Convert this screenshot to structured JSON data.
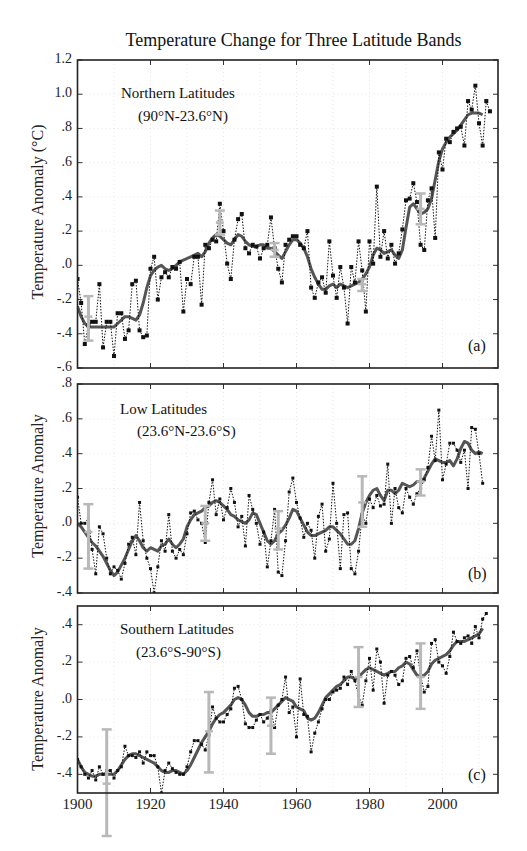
{
  "title": "Temperature Change for Three Latitude Bands",
  "x_tick_labels": [
    "1900",
    "1920",
    "1940",
    "1960",
    "1980",
    "2000"
  ],
  "panels": [
    {
      "id": "a",
      "letter": "(a)",
      "name_line1": "Northern Latitudes",
      "name_line2": "(90°N-23.6°N)",
      "ylabel": "Temperature Anomaly (°C)",
      "y_tick_labels": [
        "1.2",
        "1.0",
        ".8",
        ".6",
        ".4",
        ".2",
        ".0",
        "-.2",
        "-.4",
        "-.6"
      ]
    },
    {
      "id": "b",
      "letter": "(b)",
      "name_line1": "Low Latitudes",
      "name_line2": "(23.6°N-23.6°S)",
      "ylabel": "Temperature Anomaly",
      "y_tick_labels": [
        ".8",
        ".6",
        ".4",
        ".2",
        ".0",
        "-.2",
        "-.4"
      ]
    },
    {
      "id": "c",
      "letter": "(c)",
      "name_line1": "Southern Latitudes",
      "name_line2": "(23.6°S-90°S)",
      "ylabel": "Temperature Anomaly",
      "y_tick_labels": [
        ".4",
        ".2",
        ".0",
        "-.2",
        "-.4"
      ]
    }
  ],
  "chart_data": [
    {
      "type": "line",
      "title": "Temperature Change for Three Latitude Bands",
      "panel": "(a) Northern Latitudes (90°N-23.6°N)",
      "xlabel": "",
      "ylabel": "Temperature Anomaly (°C)",
      "xlim": [
        1900,
        2016
      ],
      "ylim": [
        -0.6,
        1.2
      ],
      "yticks": [
        1.2,
        1.0,
        0.8,
        0.6,
        0.4,
        0.2,
        0.0,
        -0.2,
        -0.4,
        -0.6
      ],
      "xticks": [
        1900,
        1920,
        1940,
        1960,
        1980,
        2000
      ],
      "grid": true,
      "x_start": 1900,
      "series": [
        {
          "name": "Annual mean",
          "style": "dotted-black-square-markers",
          "values": [
            -0.08,
            -0.22,
            -0.46,
            -0.35,
            -0.33,
            -0.33,
            -0.11,
            -0.48,
            -0.33,
            -0.33,
            -0.53,
            -0.28,
            -0.28,
            -0.43,
            -0.38,
            -0.11,
            -0.09,
            -0.38,
            -0.42,
            -0.41,
            -0.02,
            0.05,
            -0.2,
            -0.07,
            -0.04,
            -0.07,
            -0.01,
            -0.02,
            0.02,
            -0.27,
            -0.08,
            -0.11,
            0.05,
            0.05,
            -0.23,
            0.12,
            0.1,
            0.15,
            0.14,
            0.36,
            0.2,
            0.01,
            -0.08,
            0.15,
            0.27,
            0.3,
            0.1,
            0.07,
            0.12,
            0.11,
            0.04,
            0.1,
            0.12,
            0.28,
            0.1,
            -0.02,
            -0.1,
            0.12,
            0.15,
            0.17,
            0.17,
            0.12,
            0.1,
            0.2,
            -0.13,
            -0.19,
            -0.1,
            -0.07,
            -0.16,
            0.14,
            -0.06,
            -0.19,
            -0.01,
            -0.13,
            -0.34,
            -0.01,
            -0.1,
            0.14,
            -0.03,
            -0.27,
            0.14,
            0.01,
            0.46,
            0.05,
            0.2,
            0.04,
            0.12,
            0.01,
            0.07,
            0.21,
            0.38,
            0.39,
            0.48,
            0.37,
            0.12,
            0.09,
            0.38,
            0.45,
            0.16,
            0.66,
            0.56,
            0.74,
            0.72,
            0.78,
            0.8,
            0.81,
            0.7,
            0.96,
            0.91,
            1.05,
            0.83,
            0.7,
            0.96,
            0.9
          ]
        },
        {
          "name": "Smoothed",
          "style": "thick-gray-solid",
          "values": [
            -0.24,
            -0.3,
            -0.34,
            -0.36,
            -0.36,
            -0.36,
            -0.36,
            -0.36,
            -0.36,
            -0.36,
            -0.36,
            -0.34,
            -0.32,
            -0.3,
            -0.3,
            -0.31,
            -0.32,
            -0.29,
            -0.22,
            -0.13,
            -0.06,
            -0.03,
            -0.01,
            0.0,
            -0.02,
            -0.03,
            -0.02,
            0.0,
            0.02,
            0.03,
            0.04,
            0.05,
            0.06,
            0.07,
            0.05,
            0.08,
            0.13,
            0.16,
            0.18,
            0.17,
            0.15,
            0.13,
            0.12,
            0.15,
            0.18,
            0.17,
            0.14,
            0.12,
            0.11,
            0.11,
            0.12,
            0.12,
            0.1,
            0.1,
            0.08,
            0.06,
            0.04,
            0.08,
            0.12,
            0.15,
            0.15,
            0.13,
            0.1,
            0.05,
            -0.02,
            -0.07,
            -0.11,
            -0.14,
            -0.14,
            -0.12,
            -0.11,
            -0.13,
            -0.11,
            -0.12,
            -0.13,
            -0.12,
            -0.11,
            -0.1,
            -0.08,
            -0.05,
            -0.01,
            0.06,
            0.1,
            0.09,
            0.07,
            0.08,
            0.09,
            0.06,
            0.04,
            0.09,
            0.22,
            0.34,
            0.36,
            0.33,
            0.3,
            0.31,
            0.33,
            0.39,
            0.5,
            0.61,
            0.68,
            0.72,
            0.75,
            0.77,
            0.79,
            0.82,
            0.85,
            0.88,
            0.89,
            0.89,
            0.89,
            0.88
          ]
        }
      ],
      "error_bars": [
        {
          "year": 1903,
          "low": -0.44,
          "high": -0.18,
          "center": -0.3
        },
        {
          "year": 1939,
          "low": 0.18,
          "high": 0.32,
          "center": 0.25
        },
        {
          "year": 1954,
          "low": 0.05,
          "high": 0.13,
          "center": 0.09
        },
        {
          "year": 1978,
          "low": -0.15,
          "high": -0.08,
          "center": -0.11
        },
        {
          "year": 1994,
          "low": 0.24,
          "high": 0.42,
          "center": 0.33
        }
      ]
    },
    {
      "type": "line",
      "panel": "(b) Low Latitudes (23.6°N-23.6°S)",
      "xlabel": "",
      "ylabel": "Temperature Anomaly",
      "xlim": [
        1900,
        2016
      ],
      "ylim": [
        -0.4,
        0.8
      ],
      "yticks": [
        0.8,
        0.6,
        0.4,
        0.2,
        0.0,
        -0.2,
        -0.4
      ],
      "xticks": [
        1900,
        1920,
        1940,
        1960,
        1980,
        2000
      ],
      "grid": true,
      "x_start": 1900,
      "series": [
        {
          "name": "Annual mean",
          "style": "dotted-black-small-markers",
          "values": [
            0.15,
            0.0,
            0.0,
            0.03,
            -0.15,
            -0.29,
            -0.02,
            -0.06,
            -0.2,
            -0.29,
            -0.25,
            -0.27,
            -0.32,
            -0.23,
            -0.12,
            -0.08,
            -0.18,
            0.12,
            -0.1,
            -0.2,
            -0.26,
            -0.4,
            -0.25,
            -0.1,
            -0.16,
            0.05,
            -0.16,
            -0.2,
            -0.15,
            -0.18,
            -0.06,
            0.06,
            0.07,
            0.02,
            0.0,
            -0.11,
            0.12,
            0.25,
            0.05,
            0.14,
            0.02,
            0.09,
            0.2,
            0.12,
            -0.02,
            0.04,
            -0.13,
            0.16,
            0.08,
            0.0,
            -0.12,
            -0.05,
            -0.25,
            -0.1,
            0.08,
            -0.28,
            -0.3,
            -0.1,
            0.18,
            0.26,
            0.12,
            0.03,
            -0.08,
            0.0,
            -0.04,
            -0.2,
            0.04,
            0.11,
            -0.16,
            -0.09,
            0.23,
            0.0,
            -0.26,
            0.05,
            0.06,
            -0.26,
            -0.29,
            -0.16,
            0.05,
            0.0,
            0.14,
            0.09,
            0.16,
            0.1,
            0.11,
            0.34,
            0.0,
            0.2,
            0.09,
            0.06,
            0.2,
            0.15,
            0.11,
            0.17,
            0.2,
            0.25,
            0.32,
            0.5,
            0.36,
            0.65,
            0.25,
            0.34,
            0.46,
            0.46,
            0.42,
            0.35,
            0.42,
            0.2,
            0.55,
            0.54,
            0.4,
            0.23
          ]
        },
        {
          "name": "Smoothed",
          "style": "thick-gray-solid",
          "values": [
            0.0,
            -0.02,
            -0.05,
            -0.08,
            -0.11,
            -0.13,
            -0.16,
            -0.19,
            -0.23,
            -0.27,
            -0.3,
            -0.28,
            -0.24,
            -0.2,
            -0.15,
            -0.1,
            -0.07,
            -0.1,
            -0.14,
            -0.16,
            -0.14,
            -0.15,
            -0.16,
            -0.13,
            -0.12,
            -0.09,
            -0.12,
            -0.14,
            -0.12,
            -0.09,
            -0.02,
            0.02,
            0.05,
            0.06,
            0.07,
            0.09,
            0.1,
            0.12,
            0.13,
            0.12,
            0.1,
            0.08,
            0.05,
            0.04,
            0.02,
            0.01,
            0.0,
            0.02,
            0.06,
            0.05,
            0.0,
            -0.05,
            -0.1,
            -0.12,
            -0.1,
            -0.06,
            -0.04,
            -0.01,
            0.03,
            0.08,
            0.07,
            0.03,
            -0.01,
            -0.05,
            -0.07,
            -0.07,
            -0.06,
            -0.05,
            -0.04,
            -0.02,
            -0.02,
            -0.04,
            -0.06,
            -0.09,
            -0.12,
            -0.12,
            -0.1,
            -0.03,
            0.06,
            0.12,
            0.16,
            0.19,
            0.2,
            0.16,
            0.13,
            0.19,
            0.19,
            0.17,
            0.19,
            0.23,
            0.22,
            0.21,
            0.22,
            0.24,
            0.24,
            0.26,
            0.3,
            0.34,
            0.37,
            0.36,
            0.35,
            0.35,
            0.36,
            0.33,
            0.37,
            0.43,
            0.47,
            0.46,
            0.42,
            0.4,
            0.41,
            0.4
          ]
        }
      ],
      "error_bars": [
        {
          "year": 1903,
          "low": -0.26,
          "high": 0.11,
          "center": -0.05
        },
        {
          "year": 1935,
          "low": -0.1,
          "high": 0.1,
          "center": 0.0
        },
        {
          "year": 1955,
          "low": -0.15,
          "high": 0.07,
          "center": -0.03
        },
        {
          "year": 1978,
          "low": -0.02,
          "high": 0.27,
          "center": 0.12
        },
        {
          "year": 1994,
          "low": 0.16,
          "high": 0.31,
          "center": 0.24
        }
      ]
    },
    {
      "type": "line",
      "panel": "(c) Southern Latitudes (23.6°S-90°S)",
      "xlabel": "",
      "ylabel": "Temperature Anomaly",
      "xlim": [
        1900,
        2016
      ],
      "ylim": [
        -0.5,
        0.5
      ],
      "yticks": [
        0.4,
        0.2,
        0.0,
        -0.2,
        -0.4
      ],
      "xticks": [
        1900,
        1920,
        1940,
        1960,
        1980,
        2000
      ],
      "grid": true,
      "x_start": 1900,
      "series": [
        {
          "name": "Annual mean",
          "style": "dotted-black-small-markers",
          "values": [
            -0.32,
            -0.36,
            -0.4,
            -0.42,
            -0.38,
            -0.43,
            -0.36,
            -0.4,
            -0.38,
            -0.38,
            -0.42,
            -0.38,
            -0.36,
            -0.25,
            -0.3,
            -0.3,
            -0.31,
            -0.28,
            -0.34,
            -0.28,
            -0.3,
            -0.3,
            -0.36,
            -0.5,
            -0.38,
            -0.34,
            -0.37,
            -0.39,
            -0.4,
            -0.4,
            -0.36,
            -0.28,
            -0.22,
            -0.22,
            -0.24,
            -0.27,
            -0.19,
            -0.04,
            -0.1,
            -0.12,
            -0.12,
            -0.08,
            -0.05,
            0.06,
            0.07,
            0.0,
            -0.13,
            -0.15,
            -0.15,
            -0.11,
            -0.08,
            -0.12,
            -0.1,
            -0.06,
            -0.15,
            -0.03,
            0.0,
            0.12,
            -0.07,
            -0.04,
            -0.2,
            0.11,
            -0.08,
            -0.09,
            -0.28,
            -0.18,
            -0.12,
            -0.05,
            0.0,
            0.0,
            0.04,
            0.05,
            0.06,
            0.12,
            0.08,
            0.15,
            0.1,
            0.02,
            -0.03,
            0.1,
            0.22,
            0.05,
            0.27,
            0.2,
            -0.02,
            0.13,
            0.15,
            0.13,
            0.08,
            0.1,
            0.22,
            0.23,
            0.17,
            0.26,
            0.13,
            0.04,
            0.07,
            0.3,
            0.32,
            0.2,
            0.18,
            0.14,
            0.23,
            0.36,
            0.31,
            0.3,
            0.33,
            0.34,
            0.3,
            0.39,
            0.33,
            0.43,
            0.46
          ]
        },
        {
          "name": "Smoothed",
          "style": "thick-gray-solid",
          "values": [
            -0.32,
            -0.36,
            -0.39,
            -0.4,
            -0.41,
            -0.41,
            -0.4,
            -0.4,
            -0.4,
            -0.4,
            -0.4,
            -0.38,
            -0.35,
            -0.32,
            -0.3,
            -0.29,
            -0.29,
            -0.3,
            -0.31,
            -0.32,
            -0.33,
            -0.34,
            -0.36,
            -0.38,
            -0.39,
            -0.39,
            -0.38,
            -0.38,
            -0.39,
            -0.4,
            -0.38,
            -0.35,
            -0.31,
            -0.27,
            -0.23,
            -0.2,
            -0.17,
            -0.13,
            -0.1,
            -0.08,
            -0.07,
            -0.05,
            -0.03,
            0.0,
            0.01,
            0.0,
            -0.03,
            -0.07,
            -0.09,
            -0.09,
            -0.08,
            -0.08,
            -0.07,
            -0.07,
            -0.05,
            -0.03,
            -0.01,
            0.01,
            0.0,
            -0.01,
            -0.04,
            -0.05,
            -0.06,
            -0.1,
            -0.11,
            -0.1,
            -0.07,
            -0.03,
            0.01,
            0.03,
            0.05,
            0.07,
            0.08,
            0.1,
            0.12,
            0.12,
            0.11,
            0.12,
            0.14,
            0.16,
            0.17,
            0.16,
            0.15,
            0.14,
            0.13,
            0.14,
            0.15,
            0.15,
            0.17,
            0.18,
            0.2,
            0.19,
            0.16,
            0.13,
            0.12,
            0.13,
            0.15,
            0.19,
            0.21,
            0.22,
            0.23,
            0.24,
            0.26,
            0.29,
            0.31,
            0.31,
            0.31,
            0.32,
            0.33,
            0.34,
            0.35,
            0.38
          ]
        }
      ],
      "error_bars": [
        {
          "year": 1908,
          "low": -0.73,
          "high": -0.16,
          "center": -0.45
        },
        {
          "year": 1936,
          "low": -0.39,
          "high": 0.04,
          "center": -0.17
        },
        {
          "year": 1953,
          "low": -0.29,
          "high": 0.01,
          "center": -0.14
        },
        {
          "year": 1977,
          "low": -0.04,
          "high": 0.28,
          "center": 0.12
        },
        {
          "year": 1994,
          "low": -0.05,
          "high": 0.3,
          "center": 0.12
        }
      ]
    }
  ]
}
